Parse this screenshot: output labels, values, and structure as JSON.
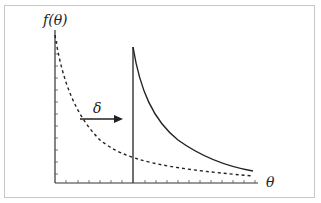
{
  "diagram": {
    "y_axis_label": "f(θ)",
    "x_axis_label": "θ",
    "shift_label": "δ",
    "colors": {
      "frame": "#c8c8c8",
      "axis": "#333333",
      "curve": "#222222",
      "background": "#ffffff"
    },
    "curves": [
      {
        "name": "original-density",
        "style": "dashed",
        "description": "decaying density starting at θ=0"
      },
      {
        "name": "shifted-density",
        "style": "solid",
        "description": "same density shifted right by δ, with vertical jump at shift point"
      }
    ],
    "y_ticks": 12,
    "x_ticks": 12
  }
}
